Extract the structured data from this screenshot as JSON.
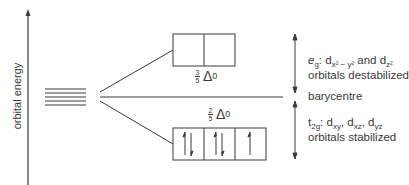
{
  "axis": {
    "label": "orbital energy"
  },
  "upper_level": {
    "fraction_num": "3",
    "fraction_den": "5",
    "delta_symbol": "Δ",
    "delta_sub": "0",
    "cells": 2,
    "label_line1_prefix": "e",
    "label_line1_prefix_sub": "g",
    "label_line1_sep": ": d",
    "label_line1_orb1_sub": "x² − y²",
    "label_line1_and": " and d",
    "label_line1_orb2_sub": "z²",
    "label_line2": "orbitals destabilized"
  },
  "barycentre": {
    "label": "barycentre"
  },
  "lower_level": {
    "fraction_num": "2",
    "fraction_den": "5",
    "delta_symbol": "Δ",
    "delta_sub": "0",
    "cells": [
      {
        "electrons": "↑↓"
      },
      {
        "electrons": "↑↓"
      },
      {
        "electrons": "↑"
      }
    ],
    "label_line1_prefix": "t",
    "label_line1_prefix_sub": "2g",
    "label_line1_sep": ": d",
    "label_line1_orb1_sub": "xy",
    "label_line1_c1": ", d",
    "label_line1_orb2_sub": "xz",
    "label_line1_c2": ", d",
    "label_line1_orb3_sub": "yz",
    "label_line2": "orbitals stabilized"
  },
  "colors": {
    "line": "#3a3a3a",
    "background": "#ffffff"
  }
}
